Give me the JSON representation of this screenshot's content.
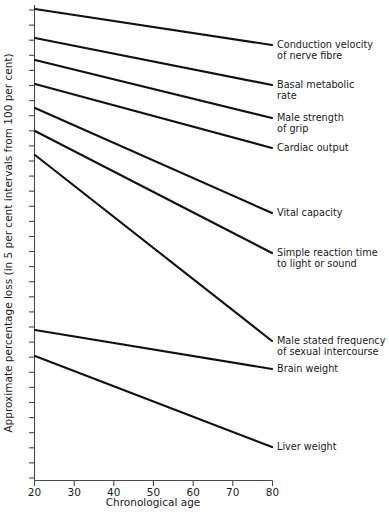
{
  "chart_data": {
    "type": "line",
    "title": "",
    "xlabel": "Chronological age",
    "ylabel": "Approximate percentage loss (in 5 per cent intervals from 100 per cent)",
    "xlim": [
      20,
      80
    ],
    "ylim": [
      0,
      100
    ],
    "xticks": [
      20,
      30,
      40,
      50,
      60,
      70,
      80
    ],
    "xtick_labels": [
      "20",
      "30",
      "40",
      "50",
      "60",
      "70",
      "80"
    ],
    "yticks_count": 32,
    "ytick_labels": [],
    "grid": false,
    "legend_position": "right-of-line-ends",
    "series": [
      {
        "name": "Conduction velocity of nerve fibre",
        "label_lines": [
          "Conduction velocity",
          "of nerve fibre"
        ],
        "x": [
          20,
          80
        ],
        "y": [
          100,
          85
        ],
        "px": {
          "x1": 35,
          "y1": 9,
          "x2": 272,
          "y2": 45
        }
      },
      {
        "name": "Basal metabolic rate",
        "label_lines": [
          "Basal metabolic",
          "rate"
        ],
        "x": [
          20,
          80
        ],
        "y": [
          94,
          77
        ],
        "px": {
          "x1": 35,
          "y1": 38,
          "x2": 272,
          "y2": 85
        }
      },
      {
        "name": "Male strength of grip",
        "label_lines": [
          "Male strength",
          "of grip"
        ],
        "x": [
          20,
          80
        ],
        "y": [
          89,
          70
        ],
        "px": {
          "x1": 35,
          "y1": 60,
          "x2": 272,
          "y2": 118
        }
      },
      {
        "name": "Cardiac output",
        "label_lines": [
          "Cardiac output"
        ],
        "x": [
          20,
          80
        ],
        "y": [
          85,
          64
        ],
        "px": {
          "x1": 35,
          "y1": 84,
          "x2": 272,
          "y2": 148
        }
      },
      {
        "name": "Vital capacity",
        "label_lines": [
          "Vital capacity"
        ],
        "x": [
          20,
          80
        ],
        "y": [
          81,
          52
        ],
        "px": {
          "x1": 35,
          "y1": 108,
          "x2": 272,
          "y2": 213
        }
      },
      {
        "name": "Simple reaction time to light or sound",
        "label_lines": [
          "Simple reaction time",
          "to light or sound"
        ],
        "x": [
          20,
          80
        ],
        "y": [
          77,
          45
        ],
        "px": {
          "x1": 35,
          "y1": 131,
          "x2": 272,
          "y2": 253
        }
      },
      {
        "name": "Male stated frequency of sexual intercourse",
        "label_lines": [
          "Male stated frequency",
          "of sexual intercourse"
        ],
        "x": [
          20,
          80
        ],
        "y": [
          72,
          22
        ],
        "px": {
          "x1": 35,
          "y1": 155,
          "x2": 272,
          "y2": 341
        }
      },
      {
        "name": "Brain weight",
        "label_lines": [
          "Brain weight"
        ],
        "x": [
          20,
          80
        ],
        "y": [
          30,
          23
        ],
        "px": {
          "x1": 35,
          "y1": 330,
          "x2": 272,
          "y2": 369
        }
      },
      {
        "name": "Liver weight",
        "label_lines": [
          "Liver weight"
        ],
        "x": [
          20,
          80
        ],
        "y": [
          24,
          3
        ],
        "px": {
          "x1": 35,
          "y1": 356,
          "x2": 272,
          "y2": 447
        }
      }
    ]
  },
  "axes": {
    "x_title": "Chronological age",
    "y_title": "Approximate percentage loss (in 5 per cent intervals from 100 per cent)",
    "x_tick_labels": [
      "20",
      "30",
      "40",
      "50",
      "60",
      "70",
      "80"
    ]
  },
  "colors": {
    "line": "#111111",
    "axis": "#4a4a4a",
    "text": "#1a1a1a",
    "background": "#ffffff"
  }
}
